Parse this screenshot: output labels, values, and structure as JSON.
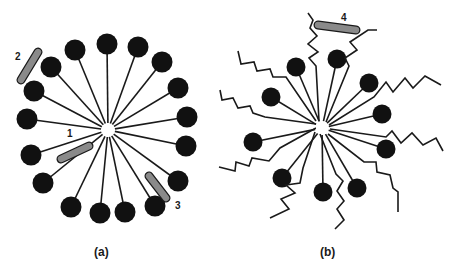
{
  "figure": {
    "panels": [
      {
        "id": "a",
        "label": "(a)",
        "description": "Micelle of surfactant molecules: polar heads (black circles) outward, tails (straight lines) pointing to central core",
        "head_count": 19,
        "tail_style": "straight",
        "guests": [
          {
            "number": "1",
            "location": "between tails, near core"
          },
          {
            "number": "2",
            "location": "outside, beside head groups"
          },
          {
            "number": "3",
            "location": "between head groups at the palisade"
          }
        ]
      },
      {
        "id": "b",
        "label": "(b)",
        "description": "Mixed micelle with headed surfactants (black circles) and long zigzag chains extending outward",
        "head_count": 10,
        "zigzag_chain_count": 9,
        "guests": [
          {
            "number": "4",
            "location": "outer region, among zigzag chains"
          }
        ]
      }
    ],
    "colors": {
      "head": "#111111",
      "line": "#1a1a1a",
      "guest_fill": "#8a8a8a",
      "guest_stroke": "#1a1a1a",
      "background": "#ffffff"
    }
  }
}
